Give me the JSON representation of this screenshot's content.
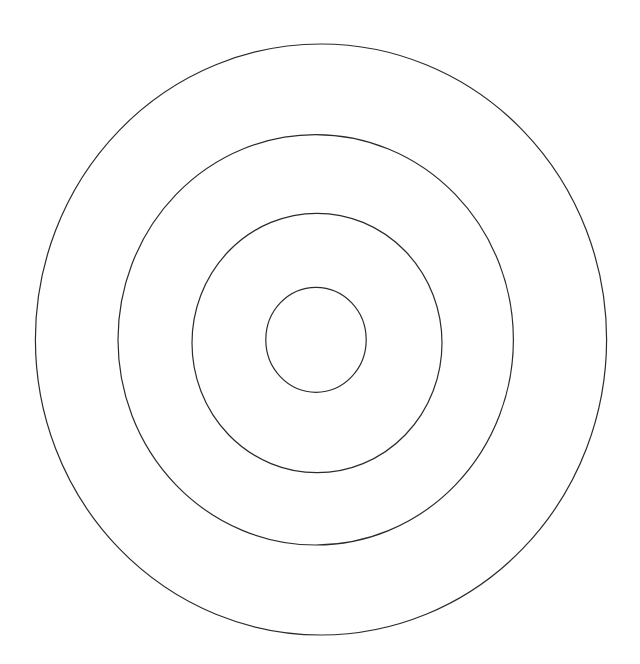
{
  "diagram": {
    "type": "concentric-circles",
    "background": "#ffffff",
    "stroke_color": "#2b2b2b",
    "stroke_width": 1.2,
    "rings": [
      {
        "name": "outer-ring",
        "cx": 321,
        "cy": 339.5,
        "rx": 285.6,
        "ry": 295.5
      },
      {
        "name": "second-ring",
        "cx": 315.7,
        "cy": 339.8,
        "rx": 197.7,
        "ry": 205.2
      },
      {
        "name": "third-ring",
        "cx": 317,
        "cy": 343,
        "rx": 125,
        "ry": 129.7
      },
      {
        "name": "inner-ring",
        "cx": 316,
        "cy": 339.8,
        "rx": 50.2,
        "ry": 52.5
      }
    ]
  }
}
